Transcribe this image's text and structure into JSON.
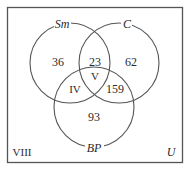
{
  "diagram": {
    "type": "venn",
    "universe_label": "U",
    "outside_region_label": "VIII",
    "colors": {
      "stroke": "#555555",
      "border": "#555555",
      "text": "#2a2a2a",
      "background": "#ffffff"
    },
    "sets": [
      {
        "id": "sm",
        "label": "Sm"
      },
      {
        "id": "c",
        "label": "C"
      },
      {
        "id": "bp",
        "label": "BP"
      }
    ],
    "regions": {
      "sm_only": "36",
      "sm_c_only": "23",
      "c_only": "62",
      "all_three": "V",
      "sm_bp_only": "IV",
      "c_bp_only": "159",
      "bp_only": "93"
    }
  }
}
